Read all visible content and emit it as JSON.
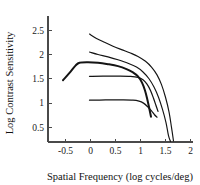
{
  "chart_data": {
    "type": "line",
    "title": "",
    "xlabel": "Spatial Frequency (log cycles/deg)",
    "ylabel": "Log Contrast Sensitivity",
    "xlim": [
      -0.85,
      2.05
    ],
    "ylim": [
      0.2,
      2.75
    ],
    "xticks": [
      -0.5,
      0,
      0.5,
      1,
      1.5,
      2
    ],
    "xtick_labels": [
      "-0.5",
      "0",
      "0.5",
      "1",
      "1.5",
      "2"
    ],
    "yticks": [
      0.5,
      1,
      1.5,
      2,
      2.5
    ],
    "ytick_labels": [
      "0.5",
      "1",
      "1.5",
      "2",
      "2.5"
    ],
    "grid": false,
    "legend": "none",
    "series": [
      {
        "name": "highest-sensitivity-curve",
        "style": "thin",
        "points": [
          [
            -0.02,
            2.42
          ],
          [
            0.12,
            2.33
          ],
          [
            0.28,
            2.25
          ],
          [
            0.45,
            2.17
          ],
          [
            0.62,
            2.1
          ],
          [
            0.8,
            2.03
          ],
          [
            0.95,
            1.96
          ],
          [
            1.1,
            1.86
          ],
          [
            1.22,
            1.74
          ],
          [
            1.33,
            1.58
          ],
          [
            1.42,
            1.38
          ],
          [
            1.5,
            1.12
          ],
          [
            1.57,
            0.82
          ],
          [
            1.62,
            0.5
          ],
          [
            1.66,
            0.22
          ]
        ]
      },
      {
        "name": "second-sensitivity-curve",
        "style": "thin",
        "points": [
          [
            -0.02,
            2.05
          ],
          [
            0.15,
            2.0
          ],
          [
            0.35,
            1.95
          ],
          [
            0.55,
            1.89
          ],
          [
            0.75,
            1.82
          ],
          [
            0.92,
            1.74
          ],
          [
            1.05,
            1.64
          ],
          [
            1.17,
            1.5
          ],
          [
            1.27,
            1.33
          ],
          [
            1.36,
            1.12
          ],
          [
            1.44,
            0.87
          ],
          [
            1.51,
            0.6
          ],
          [
            1.56,
            0.33
          ],
          [
            1.6,
            0.21
          ]
        ]
      },
      {
        "name": "thick-peaked-curve",
        "style": "thick",
        "points": [
          [
            -0.55,
            1.47
          ],
          [
            -0.42,
            1.62
          ],
          [
            -0.3,
            1.77
          ],
          [
            -0.22,
            1.83
          ],
          [
            -0.05,
            1.84
          ],
          [
            0.15,
            1.83
          ],
          [
            0.35,
            1.8
          ],
          [
            0.55,
            1.76
          ],
          [
            0.72,
            1.7
          ],
          [
            0.85,
            1.63
          ],
          [
            0.95,
            1.55
          ],
          [
            1.03,
            1.42
          ],
          [
            1.09,
            1.26
          ],
          [
            1.14,
            1.06
          ],
          [
            1.18,
            0.87
          ],
          [
            1.21,
            0.72
          ]
        ]
      },
      {
        "name": "upper-plateau-curve",
        "style": "flat",
        "points": [
          [
            -0.02,
            1.55
          ],
          [
            0.25,
            1.555
          ],
          [
            0.55,
            1.555
          ],
          [
            0.8,
            1.55
          ],
          [
            0.95,
            1.53
          ],
          [
            1.05,
            1.48
          ],
          [
            1.13,
            1.39
          ],
          [
            1.2,
            1.26
          ],
          [
            1.26,
            1.1
          ],
          [
            1.31,
            0.95
          ],
          [
            1.35,
            0.83
          ]
        ]
      },
      {
        "name": "lower-plateau-curve",
        "style": "flat",
        "points": [
          [
            -0.02,
            1.06
          ],
          [
            0.3,
            1.065
          ],
          [
            0.62,
            1.065
          ],
          [
            0.85,
            1.06
          ],
          [
            0.97,
            1.04
          ],
          [
            1.06,
            1.0
          ],
          [
            1.14,
            0.93
          ],
          [
            1.22,
            0.84
          ],
          [
            1.28,
            0.76
          ],
          [
            1.33,
            0.71
          ]
        ]
      }
    ]
  },
  "axes": {
    "x_axis_name": "spatial-frequency-axis",
    "y_axis_name": "log-contrast-sensitivity-axis"
  }
}
